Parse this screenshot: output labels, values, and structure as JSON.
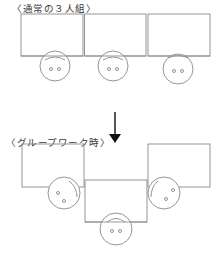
{
  "diagram": {
    "sections": [
      {
        "label": "〈通常の３人組〉",
        "arrangement": "three desks side by side in a row, each person facing forward",
        "desks": 3,
        "people": 3
      },
      {
        "label": "〈グループワーク時〉",
        "arrangement": "outer two desks rotated to face the center desk; people face each other",
        "desks": 3,
        "people": 3
      }
    ],
    "transition": {
      "icon": "down-arrow-icon",
      "meaning": "changes to"
    },
    "colors": {
      "line": "#8a8a8a",
      "arrow": "#111111",
      "text": "#3a3a3a"
    }
  }
}
